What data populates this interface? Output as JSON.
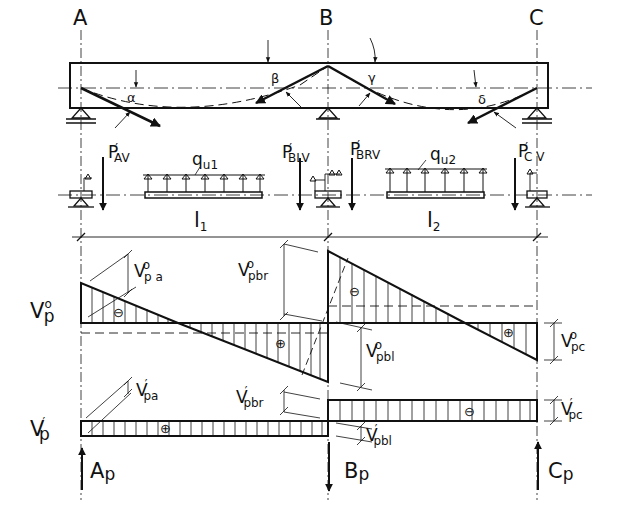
{
  "supports": {
    "a": {
      "label": "A"
    },
    "b": {
      "label": "B"
    },
    "c": {
      "label": "C"
    }
  },
  "angles": {
    "alpha": "α",
    "beta": "β",
    "gamma": "γ",
    "delta": "δ"
  },
  "free_body": {
    "p_av": {
      "main": "P",
      "prime": "′",
      "sub": "AV"
    },
    "p_blv": {
      "main": "P",
      "prime": "′",
      "sub": "BLV"
    },
    "p_brv": {
      "main": "P",
      "prime": "′",
      "sub": "BRV"
    },
    "p_cv": {
      "main": "P",
      "prime": "′",
      "sub": "C V"
    },
    "q1": {
      "main": "q",
      "sub": "u1"
    },
    "q2": {
      "main": "q",
      "sub": "u2"
    }
  },
  "spans": {
    "l1": {
      "main": "l",
      "sub": "1"
    },
    "l2": {
      "main": "l",
      "sub": "2"
    }
  },
  "diagram_vp0": {
    "label": {
      "main": "V",
      "sup": "o",
      "sub": "p"
    },
    "signs": {
      "span1_left": "⊖",
      "span1_right": "⊕",
      "span2_left": "⊖",
      "span2_right": "⊕"
    },
    "dims": {
      "vpa": {
        "main": "V",
        "sup": "o",
        "sub": "p a"
      },
      "vpbr": {
        "main": "V",
        "sup": "o",
        "sub": "pbr"
      },
      "vpbl": {
        "main": "V",
        "sup": "o",
        "sub": "pbl"
      },
      "vpc": {
        "main": "V",
        "sup": "o",
        "sub": "pc"
      }
    }
  },
  "diagram_vp1": {
    "label": {
      "main": "V",
      "sup": "′",
      "sub": "p"
    },
    "signs": {
      "span1": "⊕",
      "span2": "⊖"
    },
    "dims": {
      "vpa": {
        "main": "V",
        "sup": "′",
        "sub": "pa"
      },
      "vpbr": {
        "main": "V",
        "sup": "′",
        "sub": "pbr"
      },
      "vpbl": {
        "main": "V",
        "sup": "′",
        "sub": "pbl"
      },
      "vpc": {
        "main": "V",
        "sup": "′",
        "sub": "pc"
      }
    }
  },
  "reactions": {
    "ap": {
      "main": "A",
      "sub": "p"
    },
    "bp": {
      "main": "B",
      "sub": "p"
    },
    "cp": {
      "main": "C",
      "sub": "p"
    }
  }
}
